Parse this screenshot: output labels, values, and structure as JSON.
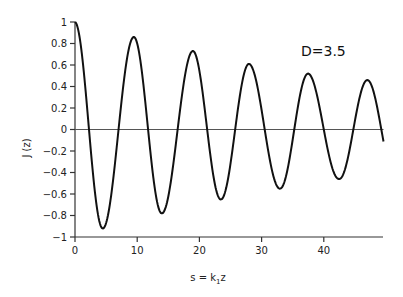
{
  "chart_data": {
    "type": "line",
    "title": "",
    "annotation": "D=3.5",
    "xlabel": "s = k₁z",
    "ylabel": "J (z)",
    "xlim": [
      0,
      50
    ],
    "ylim": [
      -1,
      1
    ],
    "xticks": [
      0,
      10,
      20,
      30,
      40
    ],
    "xtick_labels": [
      "0",
      "10",
      "20",
      "30",
      "40"
    ],
    "yticks": [
      1,
      0.8,
      0.6,
      0.4,
      0.2,
      0,
      -0.2,
      -0.4,
      -0.6,
      -0.8,
      -1
    ],
    "ytick_labels": [
      "1",
      "0.8",
      "0.6",
      "0.4",
      "0.2",
      "0",
      "-0.2",
      "-0.4",
      "-0.6",
      "-0.8",
      "-1"
    ],
    "grid": false,
    "zero_line": true,
    "series": [
      {
        "name": "J(z)",
        "color": "#111111",
        "x": [
          0,
          2.2,
          4.5,
          6.8,
          9.5,
          11.8,
          14,
          16.4,
          19,
          21.3,
          23.5,
          25.9,
          28,
          30.8,
          33,
          35.4,
          37.5,
          40.2,
          42.5,
          44.9,
          47,
          49.5
        ],
        "y": [
          1.0,
          0,
          -0.92,
          0,
          0.86,
          0,
          -0.78,
          0,
          0.73,
          0,
          -0.65,
          0,
          0.61,
          0,
          -0.55,
          0,
          0.52,
          0,
          -0.46,
          0,
          0.46,
          -0.12
        ]
      }
    ],
    "extrema": {
      "maxima": [
        [
          9.5,
          0.86
        ],
        [
          19,
          0.73
        ],
        [
          28,
          0.61
        ],
        [
          37.5,
          0.52
        ],
        [
          47,
          0.46
        ]
      ],
      "minima": [
        [
          4.5,
          -0.92
        ],
        [
          14,
          -0.78
        ],
        [
          23.5,
          -0.65
        ],
        [
          33,
          -0.55
        ],
        [
          42.5,
          -0.46
        ]
      ]
    }
  },
  "plot": {
    "x0_px": 75,
    "x_scale": 6.22,
    "y0_px": 129.5,
    "y_scale": 107.5,
    "x_end": 49.6
  }
}
